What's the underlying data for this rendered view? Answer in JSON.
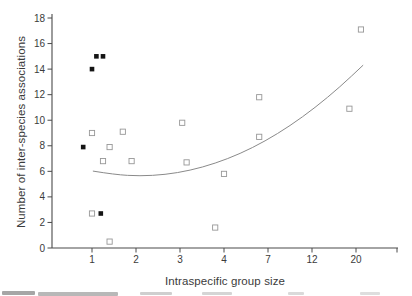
{
  "chart_data": {
    "type": "scatter",
    "title": "",
    "xlabel": "Intraspecific group size",
    "ylabel": "Number of inter-species associations",
    "x_ticks": [
      1,
      2,
      3,
      4,
      7,
      12,
      20
    ],
    "y_ticks": [
      0,
      2,
      4,
      6,
      8,
      10,
      12,
      14,
      16,
      18
    ],
    "ylim": [
      0,
      18
    ],
    "x_axis_style": "log-like axis, labeled ticks evenly spaced",
    "grid": false,
    "legend": "none",
    "colors": {
      "axis": "#4a4a4a",
      "tick_label": "#3b3b3b",
      "filled_marker": "#141414",
      "open_marker_stroke": "#979797",
      "curve": "#8a8a8a"
    },
    "series": [
      {
        "name": "filled-squares",
        "marker": "filled-square",
        "points": [
          {
            "x": 1.1,
            "y": 15
          },
          {
            "x": 1.25,
            "y": 15
          },
          {
            "x": 1.0,
            "y": 14
          },
          {
            "x": 0.8,
            "y": 7.9
          },
          {
            "x": 1.2,
            "y": 2.7
          }
        ]
      },
      {
        "name": "open-squares",
        "marker": "open-square",
        "points": [
          {
            "x": 1.0,
            "y": 9.0
          },
          {
            "x": 1.7,
            "y": 9.1
          },
          {
            "x": 1.4,
            "y": 7.9
          },
          {
            "x": 1.25,
            "y": 6.8
          },
          {
            "x": 1.9,
            "y": 6.8
          },
          {
            "x": 3.05,
            "y": 9.8
          },
          {
            "x": 3.15,
            "y": 6.7
          },
          {
            "x": 4.0,
            "y": 5.8
          },
          {
            "x": 3.8,
            "y": 1.6
          },
          {
            "x": 6.4,
            "y": 11.8
          },
          {
            "x": 6.4,
            "y": 8.7
          },
          {
            "x": 18.8,
            "y": 10.9
          },
          {
            "x": 20.9,
            "y": 17.1
          },
          {
            "x": 1.4,
            "y": 0.5
          },
          {
            "x": 1.0,
            "y": 2.7
          }
        ]
      },
      {
        "name": "fitted-curve",
        "marker": "none",
        "line": true,
        "points": [
          {
            "x": 1.02,
            "y": 6.02
          },
          {
            "x": 1.52,
            "y": 5.74
          },
          {
            "x": 2.09,
            "y": 5.63
          },
          {
            "x": 2.66,
            "y": 5.74
          },
          {
            "x": 3.23,
            "y": 6.07
          },
          {
            "x": 3.8,
            "y": 6.62
          },
          {
            "x": 5.1,
            "y": 7.38
          },
          {
            "x": 6.8,
            "y": 8.36
          },
          {
            "x": 9.5,
            "y": 9.56
          },
          {
            "x": 12.55,
            "y": 10.98
          },
          {
            "x": 17.1,
            "y": 12.61
          },
          {
            "x": 21.3,
            "y": 14.31
          }
        ]
      }
    ]
  }
}
